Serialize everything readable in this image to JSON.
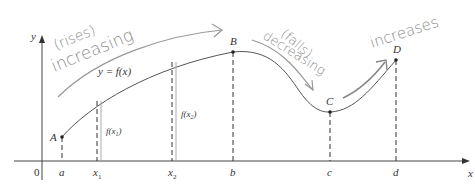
{
  "diagram": {
    "axes": {
      "x_label": "x",
      "y_label": "y",
      "origin": "0"
    },
    "curve_label": "y = f(x)",
    "points": [
      {
        "name": "A",
        "x_label": "a"
      },
      {
        "name": "B",
        "x_label": "b"
      },
      {
        "name": "C",
        "x_label": "c"
      },
      {
        "name": "D",
        "x_label": "d"
      }
    ],
    "extra_ticks": [
      {
        "label": "x1",
        "sub": "1"
      },
      {
        "label": "x2",
        "sub": "2"
      }
    ],
    "heights": [
      {
        "label": "f(x1)"
      },
      {
        "label": "f(x2)"
      }
    ],
    "annotations": [
      {
        "text": "(rises)"
      },
      {
        "text": "increasing"
      },
      {
        "text": "(falls)"
      },
      {
        "text": "decreasing"
      },
      {
        "text": "increases"
      }
    ]
  }
}
